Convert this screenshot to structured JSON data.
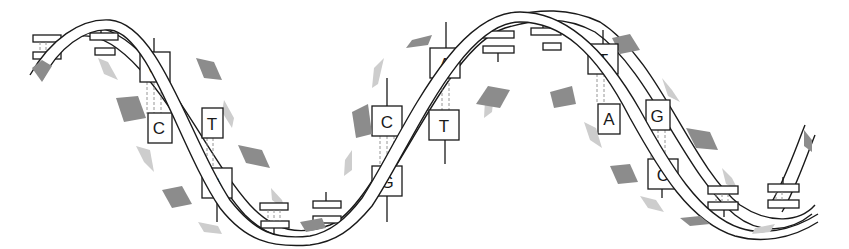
{
  "diagram": {
    "type": "dna-double-helix",
    "colors": {
      "outline": "#1a1a1a",
      "ribbon": "#ffffff",
      "patch_dark": "#8c8c8c",
      "patch_light": "#cdcdcd",
      "hydrogen_bond": "#8a8a8a",
      "background": "#ffffff"
    },
    "base_pairs": [
      {
        "top": "G",
        "bottom": "C",
        "bonds": 3
      },
      {
        "top": "T",
        "bottom": "A",
        "bonds": 2
      },
      {
        "top": "C",
        "bottom": "G",
        "bonds": 3
      },
      {
        "top": "A",
        "bottom": "T",
        "bonds": 2
      },
      {
        "top": "T",
        "bottom": "A",
        "bonds": 2
      },
      {
        "top": "G",
        "bottom": "C",
        "bonds": 3
      }
    ],
    "edge_on_base_pairs": 8
  }
}
